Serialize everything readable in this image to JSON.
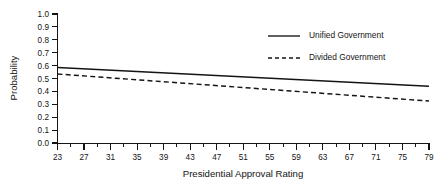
{
  "chart_data": {
    "type": "line",
    "title": "",
    "xlabel": "Presidential Approval Rating",
    "ylabel": "Probability",
    "xlim": [
      23,
      79
    ],
    "ylim": [
      0.0,
      1.0
    ],
    "grid": false,
    "legend_position": "top-right",
    "x_ticks": [
      23,
      27,
      31,
      35,
      39,
      43,
      47,
      51,
      55,
      59,
      63,
      67,
      71,
      75,
      79
    ],
    "x_tick_labels": [
      "23",
      "27",
      "31",
      "35",
      "39",
      "43",
      "47",
      "51",
      "55",
      "59",
      "63",
      "67",
      "71",
      "75",
      "79"
    ],
    "x_minor_ticks": [
      25,
      29,
      33,
      37,
      41,
      45,
      49,
      53,
      57,
      61,
      65,
      69,
      73,
      77
    ],
    "y_ticks": [
      0.0,
      0.1,
      0.2,
      0.3,
      0.4,
      0.5,
      0.6,
      0.7,
      0.8,
      0.9,
      1.0
    ],
    "y_tick_labels": [
      "0.0",
      "0.1",
      "0.2",
      "0.3",
      "0.4",
      "0.5",
      "0.6",
      "0.7",
      "0.8",
      "0.9",
      "1.0"
    ],
    "x": [
      23,
      79
    ],
    "series": [
      {
        "name": "Unified Government",
        "style": "solid",
        "color": "#141414",
        "values": [
          0.585,
          0.44
        ]
      },
      {
        "name": "Divided Government",
        "style": "dashed",
        "color": "#141414",
        "values": [
          0.535,
          0.325
        ]
      }
    ]
  },
  "axes": {
    "y_label": "Probability",
    "x_label": "Presidential Approval Rating"
  },
  "legend": {
    "items": [
      {
        "label": "Unified Government",
        "style": "solid"
      },
      {
        "label": "Divided Government",
        "style": "dashed"
      }
    ]
  }
}
